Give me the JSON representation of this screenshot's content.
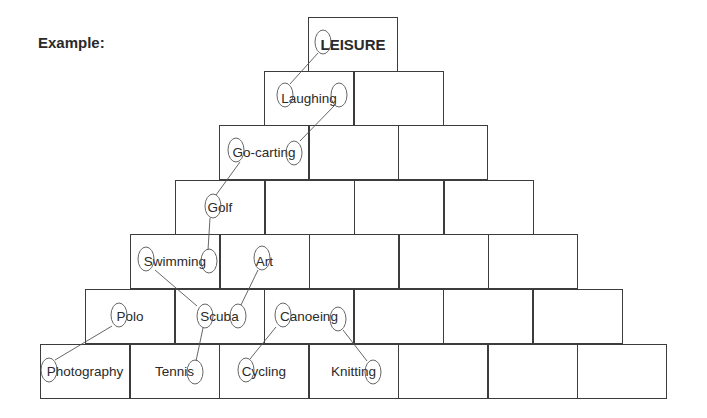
{
  "label": "Example:",
  "rows": [
    {
      "left": 308,
      "top": 17,
      "cells": [
        "LEISURE"
      ]
    },
    {
      "left": 264,
      "top": 71,
      "cells": [
        "Laughing",
        ""
      ]
    },
    {
      "left": 219,
      "top": 125,
      "cells": [
        "Go-carting",
        "",
        ""
      ]
    },
    {
      "left": 175,
      "top": 180,
      "cells": [
        "Golf",
        "",
        "",
        ""
      ]
    },
    {
      "left": 130,
      "top": 234,
      "cells": [
        "Swimming",
        "Art",
        "",
        "",
        ""
      ]
    },
    {
      "left": 85,
      "top": 289,
      "cells": [
        "Polo",
        "Scuba",
        "Canoeing",
        "",
        "",
        ""
      ]
    },
    {
      "left": 40,
      "top": 344,
      "cells": [
        "Photography",
        "Tennis",
        "Cycling",
        "Knitting",
        "",
        "",
        ""
      ]
    }
  ],
  "circles": [
    {
      "cx": 323,
      "cy": 42,
      "rx": 8,
      "ry": 12,
      "word": "LEISURE",
      "letter": "L"
    },
    {
      "cx": 285,
      "cy": 95,
      "rx": 8,
      "ry": 12,
      "word": "Laughing",
      "letter": "L"
    },
    {
      "cx": 339,
      "cy": 95,
      "rx": 8,
      "ry": 12,
      "word": "Laughing",
      "letter": "g"
    },
    {
      "cx": 236,
      "cy": 150,
      "rx": 8,
      "ry": 12,
      "word": "Go-carting",
      "letter": "G"
    },
    {
      "cx": 294,
      "cy": 153,
      "rx": 8,
      "ry": 12,
      "word": "Go-carting",
      "letter": "g"
    },
    {
      "cx": 213,
      "cy": 206,
      "rx": 8,
      "ry": 12,
      "word": "Golf",
      "letter": "G"
    },
    {
      "cx": 146,
      "cy": 259,
      "rx": 8,
      "ry": 12,
      "word": "Swimming",
      "letter": "S"
    },
    {
      "cx": 209,
      "cy": 261,
      "rx": 8,
      "ry": 12,
      "word": "Swimming",
      "letter": "g"
    },
    {
      "cx": 262,
      "cy": 258,
      "rx": 8,
      "ry": 12,
      "word": "Art",
      "letter": "A"
    },
    {
      "cx": 119,
      "cy": 315,
      "rx": 8,
      "ry": 12,
      "word": "Polo",
      "letter": "P"
    },
    {
      "cx": 205,
      "cy": 316,
      "rx": 8,
      "ry": 12,
      "word": "Scuba",
      "letter": "S"
    },
    {
      "cx": 238,
      "cy": 316,
      "rx": 8,
      "ry": 12,
      "word": "Scuba",
      "letter": "a"
    },
    {
      "cx": 283,
      "cy": 315,
      "rx": 8,
      "ry": 12,
      "word": "Canoeing",
      "letter": "C"
    },
    {
      "cx": 338,
      "cy": 319,
      "rx": 8,
      "ry": 12,
      "word": "Canoeing",
      "letter": "g"
    },
    {
      "cx": 49,
      "cy": 370,
      "rx": 8,
      "ry": 12,
      "word": "Photography",
      "letter": "P"
    },
    {
      "cx": 195,
      "cy": 372,
      "rx": 8,
      "ry": 12,
      "word": "Tennis",
      "letter": "s"
    },
    {
      "cx": 246,
      "cy": 370,
      "rx": 8,
      "ry": 12,
      "word": "Cycling",
      "letter": "C"
    },
    {
      "cx": 373,
      "cy": 372,
      "rx": 8,
      "ry": 12,
      "word": "Knitting",
      "letter": "g"
    }
  ],
  "links": [
    [
      318,
      53,
      290,
      84
    ],
    [
      334,
      106,
      300,
      141
    ],
    [
      240,
      162,
      216,
      195
    ],
    [
      210,
      218,
      208,
      250
    ],
    [
      155,
      270,
      197,
      306
    ],
    [
      258,
      270,
      241,
      305
    ],
    [
      112,
      326,
      55,
      360
    ],
    [
      203,
      328,
      196,
      361
    ],
    [
      276,
      327,
      250,
      359
    ],
    [
      343,
      330,
      367,
      361
    ]
  ]
}
